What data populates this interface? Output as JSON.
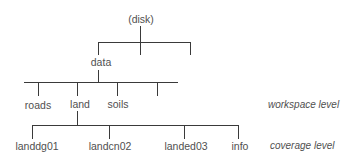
{
  "diagram": {
    "type": "tree",
    "root": {
      "label": "(disk)"
    },
    "level1": [
      {
        "label": "data"
      },
      {
        "label": ""
      },
      {
        "label": ""
      }
    ],
    "workspace": [
      {
        "label": "roads"
      },
      {
        "label": "land"
      },
      {
        "label": "soils"
      },
      {
        "label": ""
      }
    ],
    "coverages": [
      {
        "label": "landdg01"
      },
      {
        "label": "landcn02"
      },
      {
        "label": "landed03"
      },
      {
        "label": "info"
      }
    ],
    "level_labels": {
      "workspace": "workspace level",
      "coverage": "coverage level"
    },
    "line_color": "#3a3a3a",
    "text_color": "#505050"
  }
}
